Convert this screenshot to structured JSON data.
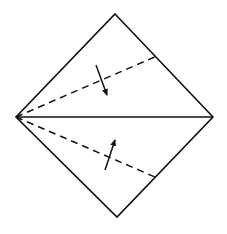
{
  "diagram": {
    "title": "",
    "type": "origami-fold-step",
    "colors": {
      "background": "#ffffff",
      "stroke": "#111111"
    },
    "square": {
      "vertices": {
        "top": [
          115,
          14
        ],
        "right": [
          213,
          117
        ],
        "bottom": [
          117,
          217
        ],
        "left": [
          16,
          117
        ]
      }
    },
    "center_crease": {
      "from": [
        16,
        117
      ],
      "to": [
        213,
        117
      ],
      "style": "solid"
    },
    "fold_lines": [
      {
        "name": "upper-valley-fold",
        "from": [
          16,
          117
        ],
        "to": [
          157,
          56
        ],
        "style": "dashed"
      },
      {
        "name": "lower-valley-fold",
        "from": [
          16,
          117
        ],
        "to": [
          155,
          177
        ],
        "style": "dashed"
      }
    ],
    "arrows": [
      {
        "name": "fold-down-arrow",
        "from": [
          96,
          65
        ],
        "to": [
          107,
          95
        ],
        "direction": "down"
      },
      {
        "name": "fold-up-arrow",
        "from": [
          105,
          170
        ],
        "to": [
          115,
          140
        ],
        "direction": "up"
      }
    ]
  }
}
